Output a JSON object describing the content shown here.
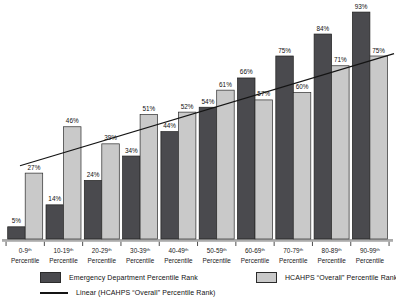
{
  "chart_data": {
    "type": "bar",
    "title": "",
    "xlabel": "",
    "ylabel": "",
    "value_suffix": "%",
    "categories": [
      "0-9",
      "10-19",
      "20-29",
      "30-39",
      "40-49",
      "50-59",
      "60-69",
      "70-79",
      "80-89",
      "90-99"
    ],
    "category_superscript": "th",
    "category_line2": "Percentile",
    "series": [
      {
        "name": "Emergency Department Percentile Rank",
        "color": "#4a4a4e",
        "values": [
          5,
          14,
          24,
          34,
          44,
          54,
          66,
          75,
          84,
          93
        ]
      },
      {
        "name": "HCAHPS “Overall” Percentile Rank",
        "color": "#c9c9c9",
        "values": [
          27,
          46,
          39,
          51,
          52,
          61,
          57,
          60,
          71,
          75
        ]
      }
    ],
    "trendline": {
      "name": "Linear (HCAHPS “Overall” Percentile Rank)",
      "fits_series": "HCAHPS “Overall” Percentile Rank",
      "start_value": 30,
      "end_value": 76,
      "color": "#141414"
    },
    "ylim": [
      0,
      100
    ],
    "grid": false,
    "legend_position": "bottom"
  },
  "legend": {
    "items": [
      {
        "label": "Emergency Department Percentile Rank",
        "swatch": "#4a4a4e",
        "type": "box"
      },
      {
        "label": "HCAHPS “Overall” Percentile Rank",
        "swatch": "#c9c9c9",
        "type": "box"
      },
      {
        "label": "Linear (HCAHPS “Overall” Percentile Rank)",
        "swatch": "#141414",
        "type": "line"
      }
    ]
  }
}
